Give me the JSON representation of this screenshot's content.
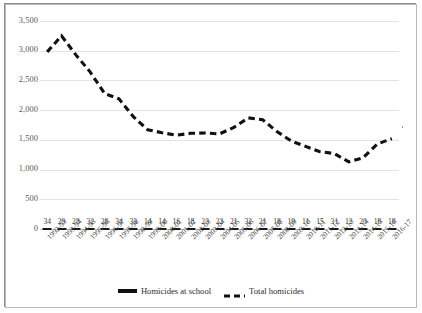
{
  "chart_data": {
    "type": "line",
    "title": "",
    "subtitle": "",
    "xlabel": "",
    "ylabel": "",
    "ylim": [
      0,
      3500
    ],
    "yticks": [
      0,
      500,
      1000,
      1500,
      2000,
      2500,
      3000,
      3500
    ],
    "ytick_labels": [
      "0",
      "500",
      "1,000",
      "1,500",
      "2,000",
      "2,500",
      "3,000",
      "3,500"
    ],
    "grid": true,
    "legend_position": "bottom",
    "categories": [
      "1992-93",
      "1993-94",
      "1994-95",
      "1995-96",
      "1996-97",
      "1997-98",
      "1998-99",
      "1999-00",
      "2000-01",
      "2001-02",
      "2002-03",
      "2003-04",
      "2004-05",
      "2005-06",
      "2006-07",
      "2007-08",
      "2008-09",
      "2009-10",
      "2010-11",
      "2011-12",
      "2012-13",
      "2013-14",
      "2014-15",
      "2015-16",
      "2016-17"
    ],
    "series": [
      {
        "name": "Homicides at school",
        "style": "solid-marker",
        "color": "#111111",
        "labels_shown": true,
        "values": [
          34,
          29,
          28,
          32,
          28,
          34,
          33,
          14,
          14,
          16,
          18,
          23,
          22,
          21,
          32,
          21,
          18,
          19,
          11,
          15,
          31,
          12,
          20,
          18,
          18
        ]
      },
      {
        "name": "Total homicides",
        "style": "dashed",
        "color": "#111111",
        "labels_shown": false,
        "values": [
          2980,
          3250,
          2930,
          2640,
          2280,
          2190,
          1890,
          1670,
          1620,
          1580,
          1610,
          1615,
          1600,
          1710,
          1870,
          1840,
          1640,
          1480,
          1390,
          1300,
          1270,
          1130,
          1200,
          1430,
          1520
        ]
      }
    ]
  },
  "legend": {
    "items": [
      {
        "label": "Homicides at school",
        "icon": "solid-line-swatch"
      },
      {
        "label": "Total homicides",
        "icon": "dashed-line-swatch"
      }
    ]
  }
}
